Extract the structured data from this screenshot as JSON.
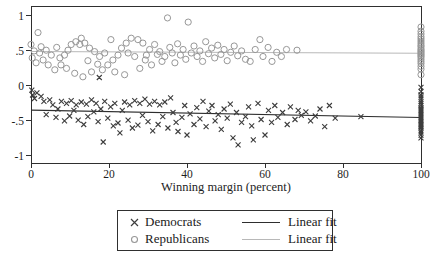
{
  "figure": {
    "background": "#ffffff"
  },
  "chart_data": {
    "type": "scatter",
    "title": "",
    "xlabel": "Winning margin (percent)",
    "ylabel": "",
    "xlim": [
      0,
      100
    ],
    "ylim": [
      -1.1,
      1.14
    ],
    "grid": false,
    "legend_position": "bottom-center",
    "frame_color": "#2f2f2f",
    "xticks": [
      {
        "v": 0,
        "t": "0"
      },
      {
        "v": 20,
        "t": "20"
      },
      {
        "v": 40,
        "t": "40"
      },
      {
        "v": 60,
        "t": "60"
      },
      {
        "v": 80,
        "t": "80"
      },
      {
        "v": 100,
        "t": "100"
      }
    ],
    "yticks": [
      {
        "v": 1,
        "t": "1"
      },
      {
        "v": 0.5,
        "t": ".5"
      },
      {
        "v": 0,
        "t": "0"
      },
      {
        "v": -0.5,
        "t": "-.5"
      },
      {
        "v": -1,
        "t": "-1"
      }
    ],
    "series": [
      {
        "name": "Democrats",
        "type": "scatter",
        "marker": "x",
        "color": "#3d3d3d",
        "points": [
          [
            0.2,
            -0.06
          ],
          [
            0.4,
            -0.13
          ],
          [
            0.9,
            -0.18
          ],
          [
            1.5,
            -0.1
          ],
          [
            2.6,
            -0.15
          ],
          [
            3.3,
            -0.22
          ],
          [
            3.9,
            -0.41
          ],
          [
            4.8,
            -0.2
          ],
          [
            5.6,
            -0.27
          ],
          [
            6.4,
            -0.45
          ],
          [
            6.9,
            -0.33
          ],
          [
            7.8,
            -0.22
          ],
          [
            8.6,
            -0.5
          ],
          [
            9.1,
            -0.25
          ],
          [
            9.9,
            -0.43
          ],
          [
            10.3,
            -0.21
          ],
          [
            11.0,
            -0.35
          ],
          [
            11.6,
            -0.27
          ],
          [
            12.1,
            -0.49
          ],
          [
            12.9,
            -0.23
          ],
          [
            13.5,
            -0.55
          ],
          [
            14.2,
            -0.26
          ],
          [
            14.6,
            -0.44
          ],
          [
            15.5,
            -0.2
          ],
          [
            16.1,
            -0.37
          ],
          [
            16.7,
            -0.25
          ],
          [
            17.2,
            -0.51
          ],
          [
            17.5,
            0.12
          ],
          [
            17.9,
            -0.33
          ],
          [
            18.5,
            -0.8
          ],
          [
            18.9,
            -0.22
          ],
          [
            19.7,
            -0.46
          ],
          [
            20.4,
            -0.3
          ],
          [
            21.1,
            -0.57
          ],
          [
            21.5,
            -0.25
          ],
          [
            22.3,
            -0.53
          ],
          [
            22.8,
            -0.67
          ],
          [
            23.4,
            -0.35
          ],
          [
            24.0,
            -0.23
          ],
          [
            24.9,
            -0.49
          ],
          [
            25.3,
            -0.27
          ],
          [
            26.0,
            -0.6
          ],
          [
            26.6,
            -0.21
          ],
          [
            27.4,
            -0.56
          ],
          [
            27.9,
            -0.25
          ],
          [
            28.6,
            -0.42
          ],
          [
            29.2,
            -0.19
          ],
          [
            30.0,
            -0.51
          ],
          [
            30.4,
            -0.26
          ],
          [
            31.2,
            -0.64
          ],
          [
            31.7,
            -0.22
          ],
          [
            32.6,
            -0.55
          ],
          [
            33.0,
            -0.27
          ],
          [
            33.8,
            -0.44
          ],
          [
            34.3,
            -0.23
          ],
          [
            35.1,
            -0.6
          ],
          [
            35.8,
            -0.17
          ],
          [
            36.4,
            -0.38
          ],
          [
            37.2,
            -0.52
          ],
          [
            37.7,
            -0.65
          ],
          [
            38.7,
            -0.45
          ],
          [
            39.4,
            -0.28
          ],
          [
            40.0,
            -0.7
          ],
          [
            40.8,
            -0.4
          ],
          [
            41.8,
            -0.55
          ],
          [
            42.5,
            -0.31
          ],
          [
            43.3,
            -0.47
          ],
          [
            44.1,
            -0.22
          ],
          [
            44.9,
            -0.58
          ],
          [
            45.6,
            -0.36
          ],
          [
            46.4,
            -0.28
          ],
          [
            47.2,
            -0.5
          ],
          [
            48.0,
            -0.41
          ],
          [
            48.8,
            -0.62
          ],
          [
            49.5,
            -0.33
          ],
          [
            50.3,
            -0.46
          ],
          [
            51.1,
            -0.26
          ],
          [
            51.8,
            -0.74
          ],
          [
            52.7,
            -0.38
          ],
          [
            53.1,
            -0.84
          ],
          [
            54.0,
            -0.52
          ],
          [
            55.0,
            -0.44
          ],
          [
            55.8,
            -0.3
          ],
          [
            56.6,
            -0.57
          ],
          [
            57.0,
            -0.77
          ],
          [
            58.2,
            -0.25
          ],
          [
            59.0,
            -0.48
          ],
          [
            60.0,
            -0.7
          ],
          [
            60.9,
            -0.35
          ],
          [
            61.7,
            -0.52
          ],
          [
            62.5,
            -0.28
          ],
          [
            63.3,
            -0.45
          ],
          [
            64.5,
            -0.38
          ],
          [
            65.7,
            -0.55
          ],
          [
            66.5,
            -0.3
          ],
          [
            67.7,
            -0.48
          ],
          [
            68.5,
            -0.35
          ],
          [
            69.3,
            -0.42
          ],
          [
            70.5,
            -0.37
          ],
          [
            71.7,
            -0.5
          ],
          [
            72.9,
            -0.43
          ],
          [
            74.1,
            -0.33
          ],
          [
            75.3,
            -0.58
          ],
          [
            76.5,
            -0.28
          ],
          [
            78.0,
            -0.46
          ],
          [
            84.6,
            -0.44
          ],
          [
            100,
            -0.02
          ],
          [
            100,
            -0.08
          ],
          [
            100,
            -0.13
          ],
          [
            100,
            -0.16
          ],
          [
            100,
            -0.19
          ],
          [
            100,
            -0.22
          ],
          [
            100,
            -0.25
          ],
          [
            100,
            -0.28
          ],
          [
            100,
            -0.31
          ],
          [
            100,
            -0.33
          ],
          [
            100,
            -0.35
          ],
          [
            100,
            -0.37
          ],
          [
            100,
            -0.39
          ],
          [
            100,
            -0.41
          ],
          [
            100,
            -0.43
          ],
          [
            100,
            -0.45
          ],
          [
            100,
            -0.47
          ],
          [
            100,
            -0.49
          ],
          [
            100,
            -0.51
          ],
          [
            100,
            -0.53
          ],
          [
            100,
            -0.55
          ],
          [
            100,
            -0.57
          ],
          [
            100,
            -0.59
          ],
          [
            100,
            -0.61
          ],
          [
            100,
            -0.64
          ],
          [
            100,
            -0.67
          ],
          [
            100,
            -0.7
          ],
          [
            100,
            -0.74
          ]
        ]
      },
      {
        "name": "Republicans",
        "type": "scatter",
        "marker": "circle",
        "color": "#979797",
        "points": [
          [
            0.0,
            0.59
          ],
          [
            0.3,
            0.4
          ],
          [
            0.8,
            0.5
          ],
          [
            1.3,
            0.33
          ],
          [
            1.8,
            0.76
          ],
          [
            2.2,
            0.47
          ],
          [
            2.6,
            0.56
          ],
          [
            3.1,
            0.37
          ],
          [
            3.9,
            0.51
          ],
          [
            4.4,
            0.3
          ],
          [
            5.2,
            0.44
          ],
          [
            6.1,
            0.23
          ],
          [
            6.6,
            0.55
          ],
          [
            7.4,
            0.4
          ],
          [
            7.7,
            0.3
          ],
          [
            8.6,
            0.44
          ],
          [
            9.1,
            0.25
          ],
          [
            9.5,
            0.51
          ],
          [
            10.3,
            0.59
          ],
          [
            11.2,
            0.18
          ],
          [
            11.5,
            0.63
          ],
          [
            12.5,
            0.59
          ],
          [
            12.9,
            0.68
          ],
          [
            13.3,
            0.13
          ],
          [
            13.8,
            0.61
          ],
          [
            14.6,
            0.36
          ],
          [
            15.0,
            0.54
          ],
          [
            15.5,
            0.2
          ],
          [
            16.3,
            0.49
          ],
          [
            17.1,
            0.31
          ],
          [
            17.6,
            0.42
          ],
          [
            18.3,
            0.23
          ],
          [
            18.9,
            0.47
          ],
          [
            19.7,
            0.3
          ],
          [
            20.5,
            0.66
          ],
          [
            21.0,
            0.37
          ],
          [
            21.5,
            0.2
          ],
          [
            22.3,
            0.44
          ],
          [
            23.2,
            0.54
          ],
          [
            24.0,
            0.16
          ],
          [
            24.4,
            0.61
          ],
          [
            24.9,
            0.47
          ],
          [
            25.7,
            0.68
          ],
          [
            26.6,
            0.42
          ],
          [
            27.4,
            0.66
          ],
          [
            27.9,
            0.25
          ],
          [
            28.7,
            0.61
          ],
          [
            29.3,
            0.37
          ],
          [
            29.6,
            0.44
          ],
          [
            30.4,
            0.52
          ],
          [
            30.9,
            0.3
          ],
          [
            31.7,
            0.59
          ],
          [
            32.4,
            0.45
          ],
          [
            33.0,
            0.49
          ],
          [
            33.6,
            0.35
          ],
          [
            34.3,
            0.42
          ],
          [
            35.0,
            0.97
          ],
          [
            35.6,
            0.55
          ],
          [
            36.2,
            0.47
          ],
          [
            36.9,
            0.33
          ],
          [
            37.6,
            0.6
          ],
          [
            38.3,
            0.44
          ],
          [
            39.0,
            0.52
          ],
          [
            39.7,
            0.38
          ],
          [
            40.3,
            0.91
          ],
          [
            41.1,
            0.47
          ],
          [
            41.8,
            0.57
          ],
          [
            42.6,
            0.42
          ],
          [
            43.3,
            0.5
          ],
          [
            44.0,
            0.35
          ],
          [
            44.8,
            0.63
          ],
          [
            45.5,
            0.46
          ],
          [
            46.3,
            0.54
          ],
          [
            47.1,
            0.4
          ],
          [
            47.9,
            0.58
          ],
          [
            48.7,
            0.45
          ],
          [
            49.5,
            0.52
          ],
          [
            50.3,
            0.36
          ],
          [
            51.2,
            0.48
          ],
          [
            52.1,
            0.57
          ],
          [
            53.0,
            0.43
          ],
          [
            54.0,
            0.5
          ],
          [
            55.0,
            0.38
          ],
          [
            56.2,
            0.35
          ],
          [
            57.5,
            0.52
          ],
          [
            58.7,
            0.66
          ],
          [
            59.5,
            0.42
          ],
          [
            60.8,
            0.55
          ],
          [
            61.8,
            0.35
          ],
          [
            63.0,
            0.48
          ],
          [
            64.2,
            0.42
          ],
          [
            65.5,
            0.52
          ],
          [
            68.2,
            0.51
          ],
          [
            100,
            0.84
          ],
          [
            100,
            0.78
          ],
          [
            100,
            0.74
          ],
          [
            100,
            0.7
          ],
          [
            100,
            0.67
          ],
          [
            100,
            0.64
          ],
          [
            100,
            0.61
          ],
          [
            100,
            0.58
          ],
          [
            100,
            0.56
          ],
          [
            100,
            0.53
          ],
          [
            100,
            0.51
          ],
          [
            100,
            0.49
          ],
          [
            100,
            0.47
          ],
          [
            100,
            0.45
          ],
          [
            100,
            0.43
          ],
          [
            100,
            0.41
          ],
          [
            100,
            0.38
          ],
          [
            100,
            0.35
          ],
          [
            100,
            0.32
          ],
          [
            100,
            0.28
          ],
          [
            100,
            0.24
          ],
          [
            100,
            0.16
          ]
        ]
      },
      {
        "name": "Linear fit",
        "type": "line",
        "color": "#2e2e2e",
        "points": [
          [
            0,
            -0.345
          ],
          [
            100,
            -0.45
          ]
        ]
      },
      {
        "name": "Linear fit",
        "type": "line",
        "color": "#b8b8b8",
        "points": [
          [
            0,
            0.49
          ],
          [
            100,
            0.465
          ]
        ]
      }
    ]
  }
}
